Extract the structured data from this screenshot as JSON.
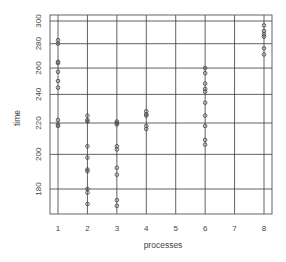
{
  "chart_data": {
    "type": "scatter",
    "title": "",
    "xlabel": "processes",
    "ylabel": "time",
    "x_ticks": [
      1,
      2,
      3,
      4,
      5,
      6,
      7,
      8
    ],
    "y_ticks": [
      180,
      200,
      220,
      240,
      260,
      280,
      300
    ],
    "xlim": [
      0.7,
      8.3
    ],
    "ylim": [
      166,
      302
    ],
    "y_scale": "log",
    "grid": true,
    "legend": null,
    "series": [
      {
        "name": "time",
        "points": [
          {
            "x": 1,
            "y": 283
          },
          {
            "x": 1,
            "y": 280
          },
          {
            "x": 1,
            "y": 265
          },
          {
            "x": 1,
            "y": 264
          },
          {
            "x": 1,
            "y": 257
          },
          {
            "x": 1,
            "y": 250
          },
          {
            "x": 1,
            "y": 245
          },
          {
            "x": 1,
            "y": 222
          },
          {
            "x": 1,
            "y": 219
          },
          {
            "x": 1,
            "y": 218
          },
          {
            "x": 2,
            "y": 225
          },
          {
            "x": 2,
            "y": 222
          },
          {
            "x": 2,
            "y": 221
          },
          {
            "x": 2,
            "y": 205
          },
          {
            "x": 2,
            "y": 198
          },
          {
            "x": 2,
            "y": 191
          },
          {
            "x": 2,
            "y": 190
          },
          {
            "x": 2,
            "y": 180
          },
          {
            "x": 2,
            "y": 178
          },
          {
            "x": 2,
            "y": 172
          },
          {
            "x": 3,
            "y": 221
          },
          {
            "x": 3,
            "y": 220
          },
          {
            "x": 3,
            "y": 219
          },
          {
            "x": 3,
            "y": 205
          },
          {
            "x": 3,
            "y": 203
          },
          {
            "x": 3,
            "y": 192
          },
          {
            "x": 3,
            "y": 188
          },
          {
            "x": 3,
            "y": 174
          },
          {
            "x": 3,
            "y": 171
          },
          {
            "x": 4,
            "y": 228
          },
          {
            "x": 4,
            "y": 226
          },
          {
            "x": 4,
            "y": 225
          },
          {
            "x": 4,
            "y": 218
          },
          {
            "x": 4,
            "y": 216
          },
          {
            "x": 6,
            "y": 260
          },
          {
            "x": 6,
            "y": 256
          },
          {
            "x": 6,
            "y": 248
          },
          {
            "x": 6,
            "y": 244
          },
          {
            "x": 6,
            "y": 242
          },
          {
            "x": 6,
            "y": 234
          },
          {
            "x": 6,
            "y": 225
          },
          {
            "x": 6,
            "y": 218
          },
          {
            "x": 6,
            "y": 209
          },
          {
            "x": 6,
            "y": 206
          },
          {
            "x": 8,
            "y": 296
          },
          {
            "x": 8,
            "y": 291
          },
          {
            "x": 8,
            "y": 288
          },
          {
            "x": 8,
            "y": 286
          },
          {
            "x": 8,
            "y": 276
          },
          {
            "x": 8,
            "y": 271
          }
        ]
      }
    ]
  },
  "style": {
    "grid_color": "#3a3a3a",
    "point_color": "#4a4a4a",
    "text_color": "#444444"
  }
}
